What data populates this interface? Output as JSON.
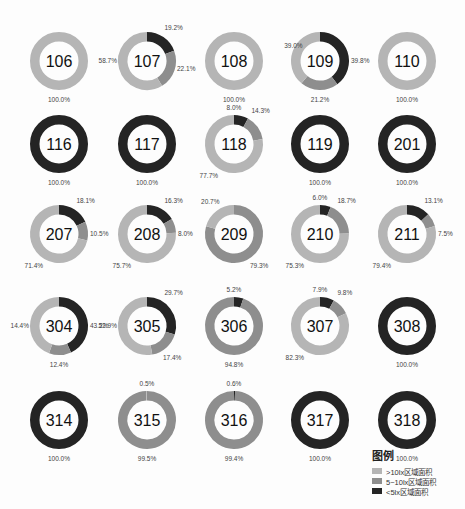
{
  "colors": {
    "light": "#b5b5b5",
    "medium": "#8e8e8e",
    "dark": "#242424"
  },
  "chart_data": {
    "type": "pie",
    "subtype": "donut-grid",
    "title": "",
    "series_order": [
      "<5lx区域面积",
      "5~10lx区域面积",
      ">10lx区域面积"
    ],
    "rooms": [
      {
        "label": "106",
        "dark": 0,
        "medium": 0,
        "light": 100.0,
        "labels": [
          {
            "t": "100.0%",
            "pos": "bottom"
          }
        ]
      },
      {
        "label": "107",
        "dark": 19.2,
        "medium": 22.1,
        "light": 58.7,
        "labels": [
          {
            "t": "19.2%",
            "pos": "top-right"
          },
          {
            "t": "22.1%",
            "pos": "right-low"
          },
          {
            "t": "58.7%",
            "pos": "left"
          }
        ]
      },
      {
        "label": "108",
        "dark": 0,
        "medium": 0,
        "light": 100.0,
        "labels": [
          {
            "t": "100.0%",
            "pos": "bottom"
          }
        ]
      },
      {
        "label": "109",
        "dark": 39.8,
        "medium": 21.2,
        "light": 39.0,
        "labels": [
          {
            "t": "39.8%",
            "pos": "right"
          },
          {
            "t": "21.2%",
            "pos": "bottom"
          },
          {
            "t": "39.0%",
            "pos": "left-top"
          }
        ]
      },
      {
        "label": "110",
        "dark": 0,
        "medium": 0,
        "light": 100.0,
        "labels": [
          {
            "t": "100.0%",
            "pos": "bottom"
          }
        ]
      },
      {
        "label": "116",
        "dark": 100.0,
        "medium": 0,
        "light": 0,
        "labels": [
          {
            "t": "100.0%",
            "pos": "bottom"
          }
        ]
      },
      {
        "label": "117",
        "dark": 100.0,
        "medium": 0,
        "light": 0,
        "labels": [
          {
            "t": "100.0%",
            "pos": "bottom"
          }
        ]
      },
      {
        "label": "118",
        "dark": 8.0,
        "medium": 14.3,
        "light": 77.7,
        "labels": [
          {
            "t": "8.0%",
            "pos": "top"
          },
          {
            "t": "14.3%",
            "pos": "top-right"
          },
          {
            "t": "77.7%",
            "pos": "bottom-left"
          }
        ]
      },
      {
        "label": "119",
        "dark": 100.0,
        "medium": 0,
        "light": 0,
        "labels": [
          {
            "t": "100.0%",
            "pos": "bottom"
          }
        ]
      },
      {
        "label": "201",
        "dark": 100.0,
        "medium": 0,
        "light": 0,
        "labels": [
          {
            "t": "100.0%",
            "pos": "bottom"
          }
        ]
      },
      {
        "label": "207",
        "dark": 18.1,
        "medium": 10.5,
        "light": 71.4,
        "labels": [
          {
            "t": "18.1%",
            "pos": "top-right"
          },
          {
            "t": "10.5%",
            "pos": "right"
          },
          {
            "t": "71.4%",
            "pos": "bottom-left"
          }
        ]
      },
      {
        "label": "208",
        "dark": 16.3,
        "medium": 8.0,
        "light": 75.7,
        "labels": [
          {
            "t": "16.3%",
            "pos": "top-right"
          },
          {
            "t": "8.0%",
            "pos": "right"
          },
          {
            "t": "75.7%",
            "pos": "bottom-left"
          }
        ]
      },
      {
        "label": "209",
        "dark": 0,
        "medium": 79.3,
        "light": 20.7,
        "labels": [
          {
            "t": "79.3%",
            "pos": "bottom-right"
          },
          {
            "t": "20.7%",
            "pos": "top-left"
          }
        ]
      },
      {
        "label": "210",
        "dark": 6.0,
        "medium": 18.7,
        "light": 75.3,
        "labels": [
          {
            "t": "6.0%",
            "pos": "top"
          },
          {
            "t": "18.7%",
            "pos": "top-right"
          },
          {
            "t": "75.3%",
            "pos": "bottom-left"
          }
        ]
      },
      {
        "label": "211",
        "dark": 13.1,
        "medium": 7.5,
        "light": 79.4,
        "labels": [
          {
            "t": "13.1%",
            "pos": "top-right"
          },
          {
            "t": "7.5%",
            "pos": "right"
          },
          {
            "t": "79.4%",
            "pos": "bottom-left"
          }
        ]
      },
      {
        "label": "304",
        "dark": 43.2,
        "medium": 12.4,
        "light": 44.4,
        "labels": [
          {
            "t": "43.2%",
            "pos": "right"
          },
          {
            "t": "12.4%",
            "pos": "bottom"
          },
          {
            "t": "14.4%",
            "pos": "left"
          }
        ]
      },
      {
        "label": "305",
        "dark": 29.7,
        "medium": 17.4,
        "light": 52.9,
        "labels": [
          {
            "t": "29.7%",
            "pos": "top-right"
          },
          {
            "t": "17.4%",
            "pos": "bottom-right"
          },
          {
            "t": "52.9%",
            "pos": "left"
          }
        ]
      },
      {
        "label": "306",
        "dark": 5.2,
        "medium": 94.8,
        "light": 0,
        "labels": [
          {
            "t": "5.2%",
            "pos": "top"
          },
          {
            "t": "94.8%",
            "pos": "bottom"
          }
        ]
      },
      {
        "label": "307",
        "dark": 7.9,
        "medium": 9.8,
        "light": 82.3,
        "labels": [
          {
            "t": "7.9%",
            "pos": "top"
          },
          {
            "t": "9.8%",
            "pos": "top-right"
          },
          {
            "t": "82.3%",
            "pos": "bottom-left"
          }
        ]
      },
      {
        "label": "308",
        "dark": 100.0,
        "medium": 0,
        "light": 0,
        "labels": [
          {
            "t": "100.0%",
            "pos": "bottom"
          }
        ]
      },
      {
        "label": "314",
        "dark": 100.0,
        "medium": 0,
        "light": 0,
        "labels": [
          {
            "t": "100.0%",
            "pos": "bottom"
          }
        ]
      },
      {
        "label": "315",
        "dark": 0,
        "medium": 99.5,
        "light": 0.5,
        "labels": [
          {
            "t": "0.5%",
            "pos": "top"
          },
          {
            "t": "99.5%",
            "pos": "bottom"
          }
        ]
      },
      {
        "label": "316",
        "dark": 0.6,
        "medium": 99.4,
        "light": 0,
        "labels": [
          {
            "t": "0.6%",
            "pos": "top"
          },
          {
            "t": "99.4%",
            "pos": "bottom"
          }
        ]
      },
      {
        "label": "317",
        "dark": 100.0,
        "medium": 0,
        "light": 0,
        "labels": [
          {
            "t": "100.0%",
            "pos": "bottom"
          }
        ]
      },
      {
        "label": "318",
        "dark": 100.0,
        "medium": 0,
        "light": 0,
        "labels": [
          {
            "t": "100.0%",
            "pos": "bottom"
          }
        ]
      }
    ],
    "legend": {
      "title": "图例",
      "position": "bottom-right",
      "items": [
        {
          "label": ">10lx区域面积",
          "color": "#b5b5b5"
        },
        {
          "label": "5~10lx区域面积",
          "color": "#8e8e8e"
        },
        {
          "label": "<5lx区域面积",
          "color": "#242424"
        }
      ]
    }
  }
}
